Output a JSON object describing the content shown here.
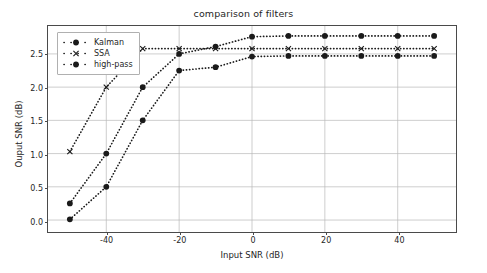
{
  "chart_data": {
    "type": "line",
    "title": "comparison of filters",
    "xlabel": "Input SNR (dB)",
    "ylabel": "Ouput SNR (dB)",
    "xlim": [
      -56,
      56
    ],
    "ylim": [
      -0.18,
      2.92
    ],
    "xticks": [
      -40,
      -20,
      0,
      20,
      40
    ],
    "xticklabels": [
      "-40",
      "-20",
      "0",
      "20",
      "40"
    ],
    "yticks": [
      0.0,
      0.5,
      1.0,
      1.5,
      2.0,
      2.5
    ],
    "yticklabels": [
      "0.0",
      "0.5",
      "1.0",
      "1.5",
      "2.0",
      "2.5"
    ],
    "grid": true,
    "grid_color": "#b8b8b8",
    "legend_position": "upper left",
    "linestyle": "dotted",
    "color": "#1a1a1a",
    "x": [
      -50,
      -40,
      -30,
      -20,
      -10,
      0,
      10,
      20,
      30,
      40,
      50
    ],
    "series": [
      {
        "name": "Kalman",
        "marker": "circle",
        "values": [
          0.25,
          1.0,
          2.0,
          2.5,
          2.61,
          2.76,
          2.77,
          2.77,
          2.77,
          2.77,
          2.77
        ]
      },
      {
        "name": "SSA",
        "marker": "x",
        "values": [
          1.03,
          2.0,
          2.58,
          2.58,
          2.58,
          2.58,
          2.58,
          2.58,
          2.58,
          2.58,
          2.58
        ]
      },
      {
        "name": "high-pass",
        "marker": "circle",
        "values": [
          0.01,
          0.5,
          1.5,
          2.25,
          2.3,
          2.46,
          2.47,
          2.47,
          2.47,
          2.47,
          2.47
        ]
      }
    ]
  },
  "legend": {
    "items": [
      {
        "label": "Kalman"
      },
      {
        "label": "SSA"
      },
      {
        "label": "high-pass"
      }
    ]
  }
}
